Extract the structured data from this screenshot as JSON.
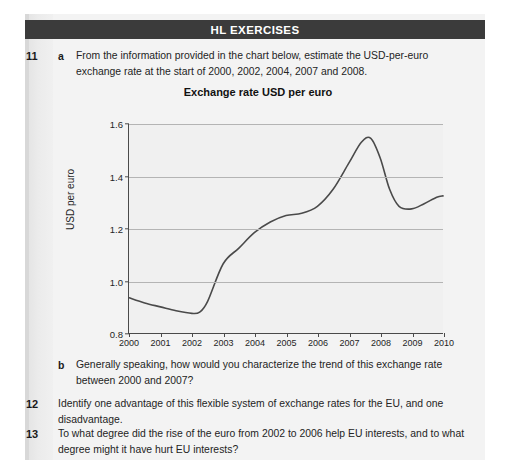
{
  "header": {
    "title": "HL EXERCISES"
  },
  "exercises": [
    {
      "number": "11",
      "parts": [
        {
          "label": "a",
          "text": "From the information provided in the chart below, estimate the USD-per-euro exchange rate at the start of 2000, 2002, 2004, 2007 and 2008."
        },
        {
          "label": "b",
          "text": "Generally speaking, how would you characterize the trend of this exchange rate between 2000 and 2007?"
        }
      ]
    },
    {
      "number": "12",
      "parts": [
        {
          "label": "",
          "text": "Identify one advantage of this flexible system of exchange rates for the EU, and one disadvantage."
        }
      ]
    },
    {
      "number": "13",
      "parts": [
        {
          "label": "",
          "text": "To what degree did the rise of the euro from 2002 to 2006 help EU interests, and to what degree might it have hurt EU interests?"
        }
      ]
    }
  ],
  "chart_data": {
    "type": "line",
    "title": "Exchange rate USD per euro",
    "xlabel": "",
    "ylabel": "USD per euro",
    "xlim": [
      2000,
      2010
    ],
    "ylim": [
      0.8,
      1.6
    ],
    "yticks": [
      0.8,
      1.0,
      1.2,
      1.4,
      1.6
    ],
    "ytick_labels": [
      "0.8",
      "1.0",
      "1.2",
      "1.4",
      "1.6"
    ],
    "xticks": [
      2000,
      2001,
      2002,
      2003,
      2004,
      2005,
      2006,
      2007,
      2008,
      2009,
      2010
    ],
    "xtick_labels": [
      "2000",
      "2001",
      "2002",
      "2003",
      "2004",
      "2005",
      "2006",
      "2007",
      "2008",
      "2009",
      "2010"
    ],
    "grid": true,
    "legend": null,
    "line_color": "#4a4a4a",
    "plot_background": "#f0f0f0",
    "series": [
      {
        "name": "USD per euro",
        "x": [
          2000.0,
          2000.5,
          2001.0,
          2001.5,
          2002.0,
          2002.25,
          2002.5,
          2003.0,
          2003.5,
          2004.0,
          2004.5,
          2005.0,
          2005.5,
          2006.0,
          2006.5,
          2007.0,
          2007.4,
          2007.7,
          2008.0,
          2008.3,
          2008.6,
          2009.0,
          2009.4,
          2009.8,
          2010.0
        ],
        "y": [
          0.935,
          0.915,
          0.9,
          0.885,
          0.875,
          0.88,
          0.92,
          1.065,
          1.125,
          1.185,
          1.225,
          1.25,
          1.258,
          1.285,
          1.35,
          1.45,
          1.53,
          1.545,
          1.47,
          1.35,
          1.285,
          1.275,
          1.295,
          1.32,
          1.325
        ]
      }
    ],
    "annotations": []
  }
}
